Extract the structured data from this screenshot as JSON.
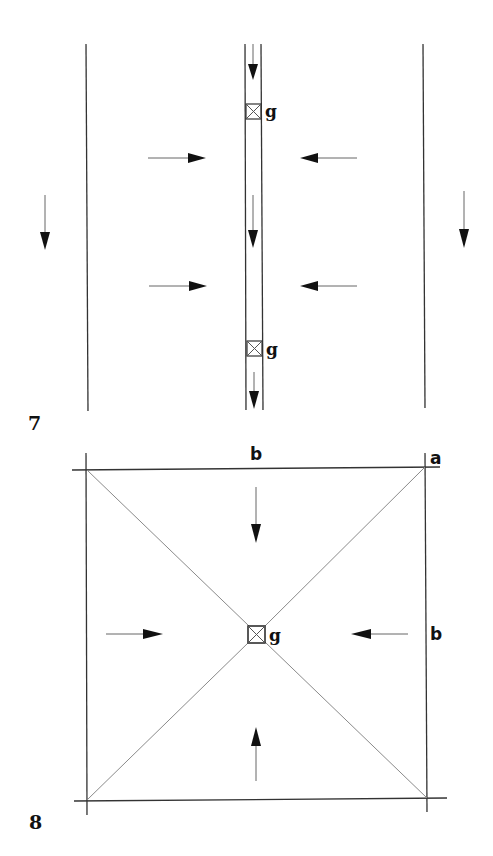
{
  "figures": [
    {
      "number": "7",
      "description": "Channel drainage: two outer boundary lines, central narrow channel with two gullies; lateral falls toward channel, longitudinal fall downward",
      "gully_labels": [
        "g",
        "g"
      ],
      "flow_arrows": {
        "outer_left": "down",
        "outer_right": "down",
        "lateral_left": [
          "right",
          "right"
        ],
        "lateral_right": [
          "left",
          "left"
        ],
        "channel": [
          "down",
          "down",
          "down"
        ]
      }
    },
    {
      "number": "8",
      "description": "Square area with diagonals falling to a central gully",
      "corner_label": "a",
      "side_label_top": "b",
      "side_label_right": "b",
      "gully_label": "g",
      "flow_arrows": {
        "top": "down",
        "bottom": "up",
        "left": "right",
        "right": "left"
      }
    }
  ]
}
